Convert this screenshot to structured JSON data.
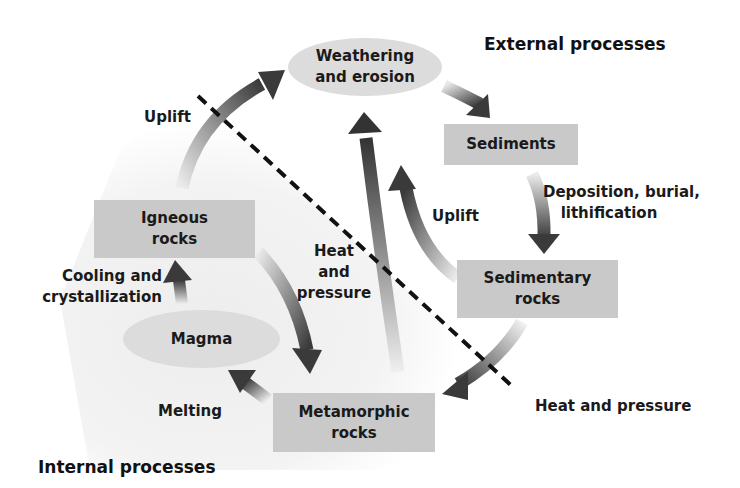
{
  "diagram": {
    "headings": {
      "external": "External processes",
      "internal": "Internal processes"
    },
    "nodes": {
      "weathering": {
        "line1": "Weathering",
        "line2": "and erosion",
        "shape": "ellipse"
      },
      "sediments": {
        "line1": "Sediments",
        "shape": "box"
      },
      "sedimentary_rocks": {
        "line1": "Sedimentary",
        "line2": "rocks",
        "shape": "box"
      },
      "metamorphic_rocks": {
        "line1": "Metamorphic",
        "line2": "rocks",
        "shape": "box"
      },
      "igneous_rocks": {
        "line1": "Igneous",
        "line2": "rocks",
        "shape": "box"
      },
      "magma": {
        "line1": "Magma",
        "shape": "ellipse"
      }
    },
    "edge_labels": {
      "uplift_igneous": "Uplift",
      "deposition_line1": "Deposition, burial,",
      "deposition_line2": "lithification",
      "uplift_sedimentary": "Uplift",
      "heat_pressure_center_line1": "Heat",
      "heat_pressure_center_line2": "and",
      "heat_pressure_center_line3": "pressure",
      "heat_pressure_right": "Heat and pressure",
      "melting": "Melting",
      "cooling_line1": "Cooling and",
      "cooling_line2": "crystallization"
    },
    "edges": [
      {
        "from": "Weathering and erosion",
        "to": "Sediments",
        "label": ""
      },
      {
        "from": "Sediments",
        "to": "Sedimentary rocks",
        "label": "Deposition, burial, lithification"
      },
      {
        "from": "Sedimentary rocks",
        "to": "Weathering and erosion",
        "label": "Uplift"
      },
      {
        "from": "Sedimentary rocks",
        "to": "Metamorphic rocks",
        "label": "Heat and pressure"
      },
      {
        "from": "Metamorphic rocks",
        "to": "Weathering and erosion",
        "label": ""
      },
      {
        "from": "Metamorphic rocks",
        "to": "Magma",
        "label": "Melting"
      },
      {
        "from": "Magma",
        "to": "Igneous rocks",
        "label": "Cooling and crystallization"
      },
      {
        "from": "Igneous rocks",
        "to": "Metamorphic rocks",
        "label": "Heat and pressure"
      },
      {
        "from": "Igneous rocks",
        "to": "Weathering and erosion",
        "label": "Uplift"
      }
    ],
    "colors": {
      "box_fill": "#c9c9c9",
      "ellipse_fill": "#dcdcdc",
      "internal_region": "#f0f0f0",
      "arrow_dark": "#3a3a3a",
      "arrow_light": "#e4e4e4",
      "divider": "#111111"
    }
  }
}
